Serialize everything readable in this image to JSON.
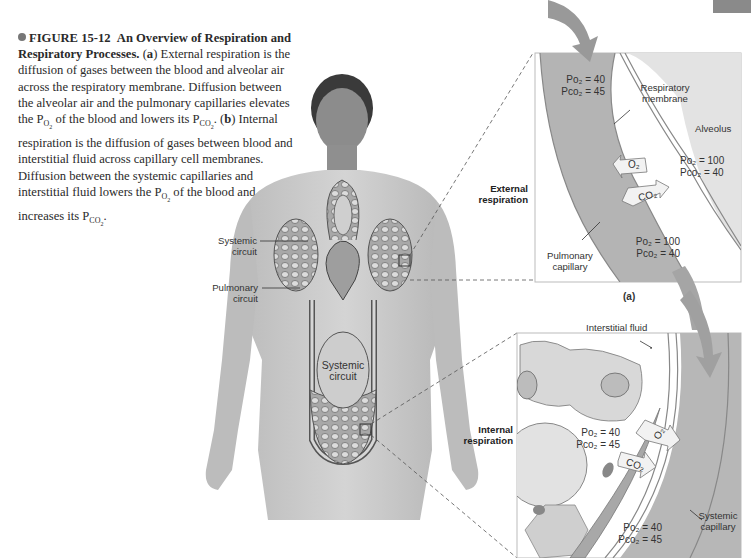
{
  "figure": {
    "number": "FIGURE 15-12",
    "title": "An Overview of Respiration and Respiratory Processes.",
    "caption_parts": {
      "a_label": "a",
      "a_text_1": "External respiration is the diffusion of gases between the blood and alveolar air across the respiratory membrane. Diffusion between the alveolar air and the pulmonary capillaries elevates the P",
      "a_sub_1": "O",
      "a_sub_1n": "2",
      "a_text_2": " of the blood and lowers its P",
      "a_sub_2": "CO",
      "a_sub_2n": "2",
      "a_text_3": ". (",
      "b_label": "b",
      "b_text_1": ") Internal respiration is the diffusion of gases between blood and interstitial fluid across capillary cell membranes. Diffusion between the systemic capillaries and interstitial fluid lowers the P",
      "b_sub_1": "O",
      "b_sub_1n": "2",
      "b_text_2": " of the blood and increases its P",
      "b_sub_2": "CO",
      "b_sub_2n": "2",
      "b_text_3": "."
    }
  },
  "body_labels": {
    "systemic_upper": "Systemic circuit",
    "pulmonary": "Pulmonary circuit",
    "systemic_lower": "Systemic circuit"
  },
  "panel_a": {
    "side_label": "External respiration",
    "panel_letter": "(a)",
    "respiratory_membrane": "Respiratory membrane",
    "alveolus": "Alveolus",
    "pulmonary_capillary": "Pulmonary capillary",
    "gas_in": "O₂",
    "gas_out": "CO₂",
    "blood_in": {
      "po2": "Po₂ = 40",
      "pco2": "Pco₂ = 45"
    },
    "alveolus_values": {
      "po2": "Po₂ = 100",
      "pco2": "Pco₂ = 40"
    },
    "blood_out": {
      "po2": "Po₂ = 100",
      "pco2": "Pco₂ = 40"
    }
  },
  "panel_b": {
    "side_label": "Internal respiration",
    "interstitial_fluid": "Interstitial fluid",
    "systemic_capillary": "Systemic capillary",
    "gas_out": "O₂",
    "gas_in": "CO₂",
    "tissue_values": {
      "po2": "Po₂ = 40",
      "pco2": "Pco₂ = 45"
    },
    "blood_out": {
      "po2": "Po₂ = 40",
      "pco2": "Pco₂ = 45"
    }
  },
  "colors": {
    "capillary": "#b9b9b9",
    "alveolus": "#e6e6e6",
    "skin": "#c9c9c9",
    "arrow": "#9a9a9a",
    "bullet": "#777777"
  }
}
